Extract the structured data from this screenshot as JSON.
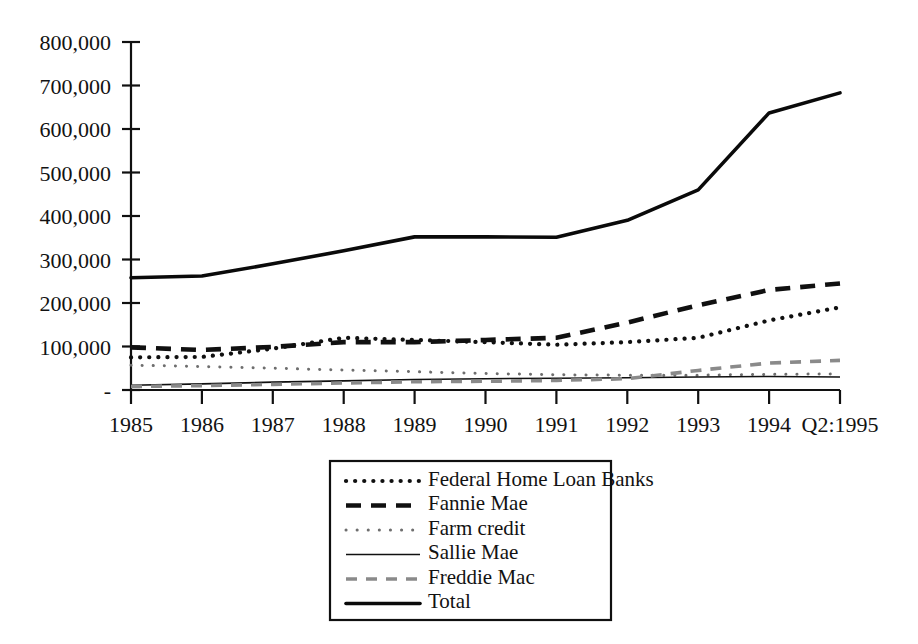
{
  "chart_data": {
    "type": "line",
    "title": "",
    "subtitle": "",
    "xlabel": "",
    "ylabel": "",
    "grid": false,
    "legend_position": "bottom-center",
    "legend_box": true,
    "categories": [
      "1985",
      "1986",
      "1987",
      "1988",
      "1989",
      "1990",
      "1991",
      "1992",
      "1993",
      "1994",
      "Q2:1995"
    ],
    "x_tick_labels": [
      "1985",
      "1986",
      "1987",
      "1988",
      "1989",
      "1990",
      "1991",
      "1992",
      "1993",
      "1994",
      "Q2:1995"
    ],
    "y_tick_labels": [
      "-",
      "100,000",
      "200,000",
      "300,000",
      "400,000",
      "500,000",
      "600,000",
      "700,000",
      "800,000"
    ],
    "y_tick_values": [
      0,
      100000,
      200000,
      300000,
      400000,
      500000,
      600000,
      700000,
      800000
    ],
    "ylim": [
      0,
      800000
    ],
    "series": [
      {
        "name": "Federal Home Loan Banks",
        "style": "dotted",
        "color": "#101010",
        "values": [
          75000,
          76000,
          95000,
          120000,
          115000,
          110000,
          104000,
          110000,
          120000,
          160000,
          190000
        ]
      },
      {
        "name": "Fannie Mae",
        "style": "dashed",
        "color": "#101010",
        "values": [
          98000,
          92000,
          99000,
          110000,
          110000,
          115000,
          120000,
          155000,
          195000,
          230000,
          245000
        ]
      },
      {
        "name": "Farm credit",
        "style": "fine-dotted",
        "color": "#6e6e6e",
        "values": [
          57000,
          54000,
          50000,
          46000,
          42000,
          38000,
          35000,
          34000,
          34000,
          36000,
          37000
        ]
      },
      {
        "name": "Sallie Mae",
        "style": "solid-thin",
        "color": "#101010",
        "values": [
          11000,
          14000,
          18000,
          21000,
          24000,
          26000,
          27000,
          28000,
          30000,
          31000,
          30000
        ]
      },
      {
        "name": "Freddie Mac",
        "style": "dashed-gray",
        "color": "#8a8a8a",
        "values": [
          8000,
          10000,
          13000,
          16000,
          19000,
          20000,
          22000,
          26000,
          45000,
          62000,
          68000
        ]
      },
      {
        "name": "Total",
        "style": "solid-thick",
        "color": "#0a0a0a",
        "values": [
          258000,
          262000,
          290000,
          320000,
          352000,
          352000,
          351000,
          390000,
          460000,
          637000,
          683000
        ]
      }
    ]
  },
  "legend": {
    "entries": [
      {
        "label": "Federal Home Loan Banks",
        "swatch": "dotted"
      },
      {
        "label": "Fannie Mae",
        "swatch": "dashed"
      },
      {
        "label": "Farm credit",
        "swatch": "fine-dotted"
      },
      {
        "label": "Sallie Mae",
        "swatch": "solid-thin"
      },
      {
        "label": "Freddie Mac",
        "swatch": "dashed-gray"
      },
      {
        "label": "Total",
        "swatch": "solid-thick"
      }
    ]
  },
  "colors": {
    "ink": "#101010",
    "gray": "#8a8a8a",
    "background": "#ffffff"
  }
}
